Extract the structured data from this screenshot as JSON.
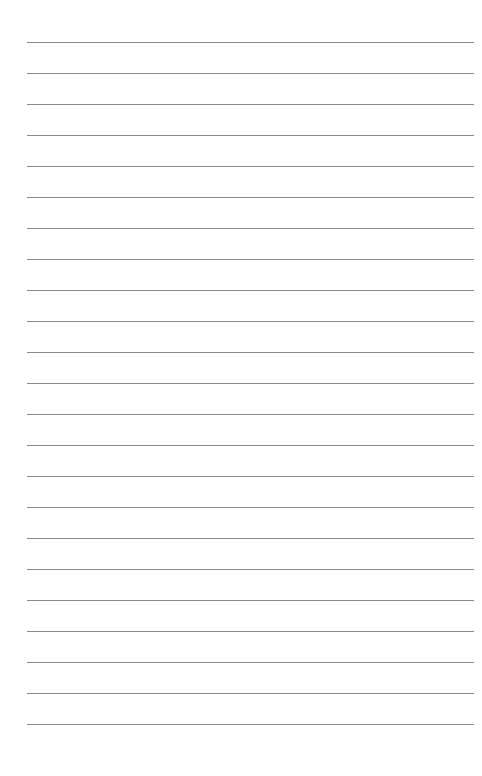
{
  "page": {
    "type": "lined-paper",
    "background_color": "#ffffff",
    "line_color": "#8a8a8a",
    "line_count": 23,
    "first_line_y": 42,
    "line_spacing": 31.0,
    "line_left": 27,
    "line_right": 474
  }
}
